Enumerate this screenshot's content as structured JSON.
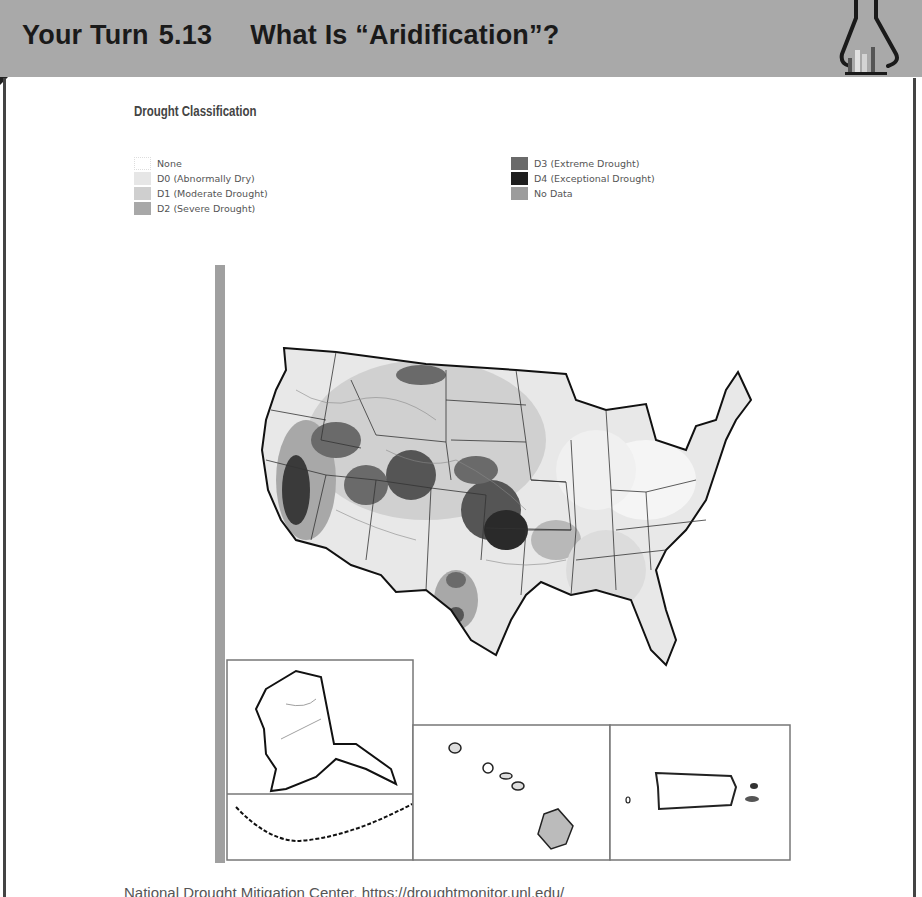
{
  "header": {
    "label": "Your Turn",
    "number": "5.13",
    "title": "What Is “Aridification”?",
    "icon": "flask-chart-icon",
    "background": "#a9a9a9"
  },
  "legend": {
    "title": "Drought Classification",
    "items": [
      {
        "label": "None",
        "color": "#ffffff"
      },
      {
        "label": "D0 (Abnormally Dry)",
        "color": "#e6e6e6"
      },
      {
        "label": "D1 (Moderate Drought)",
        "color": "#cfcfcf"
      },
      {
        "label": "D2 (Severe Drought)",
        "color": "#a8a8a8"
      },
      {
        "label": "D3 (Extreme Drought)",
        "color": "#6a6a6a"
      },
      {
        "label": "D4 (Exceptional Drought)",
        "color": "#1e1e1e"
      },
      {
        "label": "No Data",
        "color": "#9c9c9c"
      }
    ]
  },
  "map": {
    "subject": "U.S. Drought Monitor map",
    "regions": [
      "Contiguous United States",
      "Alaska",
      "Hawaii",
      "Puerto Rico"
    ]
  },
  "caption": "National Drought Mitigation Center, https://droughtmonitor.unl.edu/"
}
